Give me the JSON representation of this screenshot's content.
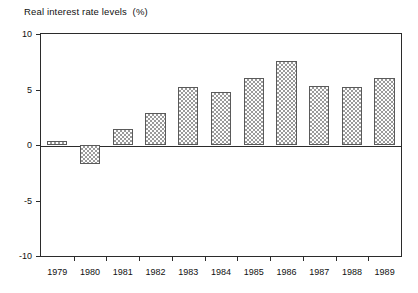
{
  "chart_data": {
    "type": "bar",
    "title": "Real interest rate levels  (%)",
    "xlabel": "",
    "ylabel": "",
    "ylim": [
      -10,
      10
    ],
    "yticks": [
      10,
      5,
      0,
      -5,
      -10
    ],
    "ytick_labels": [
      "10",
      "5",
      "0",
      "-5",
      "-10"
    ],
    "grid": false,
    "legend": false,
    "categories": [
      "1979",
      "1980",
      "1981",
      "1982",
      "1983",
      "1984",
      "1985",
      "1986",
      "1987",
      "1988",
      "1989"
    ],
    "values": [
      0.4,
      -1.7,
      1.4,
      2.9,
      5.2,
      4.8,
      6.0,
      7.6,
      5.3,
      5.2,
      6.0
    ],
    "series": [
      {
        "name": "Real interest rate levels (%)",
        "values": [
          0.4,
          -1.7,
          1.4,
          2.9,
          5.2,
          4.8,
          6.0,
          7.6,
          5.3,
          5.2,
          6.0
        ]
      }
    ],
    "bar_fill": "crosshatch",
    "colors": {
      "axis": "#2b2b2b",
      "bar_edge": "#5a5a5a",
      "bar_fill": "#9a9a9a",
      "background": "#ffffff",
      "text": "#111111"
    }
  }
}
